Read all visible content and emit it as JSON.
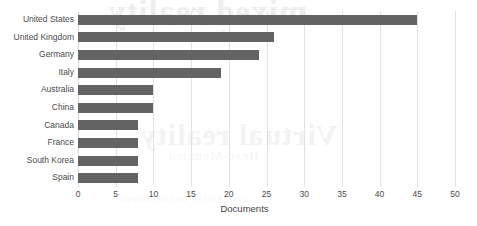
{
  "chart_data": {
    "type": "bar",
    "orientation": "horizontal",
    "title": "",
    "xlabel": "Documents",
    "ylabel": "",
    "categories": [
      "United States",
      "United Kingdom",
      "Germany",
      "Italy",
      "Australia",
      "China",
      "Canada",
      "France",
      "South Korea",
      "Spain"
    ],
    "values": [
      45,
      26,
      24,
      19,
      10,
      10,
      8,
      8,
      8,
      8
    ],
    "xlim": [
      0,
      50
    ],
    "xticks": [
      0,
      5,
      10,
      15,
      20,
      25,
      30,
      35,
      40,
      45,
      50
    ],
    "xtick_labels": [
      "0",
      "5",
      "10",
      "15",
      "20",
      "25",
      "30",
      "35",
      "40",
      "45",
      "50"
    ],
    "grid": true,
    "grid_axis": "x",
    "legend": false,
    "bar_color": "#636363",
    "grid_color": "#e2e2e2",
    "background_color": "#ffffff",
    "text_color": "#4a4a4a"
  },
  "watermark": {
    "top_line": "mixed reality",
    "top_sub": "Augmented",
    "mid_line": "Virtual reality",
    "mid_sub": "Head-Mounted",
    "bottom_line": "immersive environment"
  }
}
